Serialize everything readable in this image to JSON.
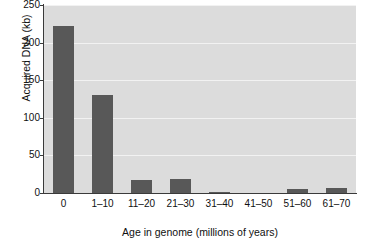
{
  "chart_data": {
    "type": "bar",
    "title": "",
    "xlabel": "Age in genome (millions of years)",
    "ylabel": "Acquired DNA (kb)",
    "categories": [
      "0",
      "1–10",
      "11–20",
      "21–30",
      "31–40",
      "41–50",
      "51–60",
      "61–70"
    ],
    "values": [
      222,
      130,
      17,
      19,
      2,
      0,
      5,
      7
    ],
    "ylim": [
      0,
      250
    ],
    "yticks": [
      0,
      50,
      100,
      150,
      200,
      250
    ],
    "ytick_labels": [
      "0",
      "50",
      "100",
      "150",
      "200",
      "250"
    ],
    "grid": "horizontal",
    "legend": "none",
    "series": [
      {
        "name": "Acquired DNA",
        "values": [
          222,
          130,
          17,
          19,
          2,
          0,
          5,
          7
        ]
      }
    ],
    "colors": {
      "bar": "#585858",
      "plot_background": "#dcdcdc",
      "gridline": "#f2f2f2",
      "axis": "#3a3a3a",
      "text": "#101010",
      "figure_background": "#ffffff"
    }
  }
}
